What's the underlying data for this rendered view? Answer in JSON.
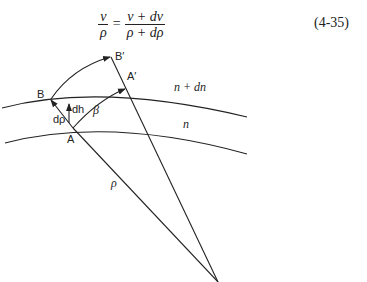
{
  "equation": {
    "lhs_num": "v",
    "lhs_den": "ρ",
    "equals": "=",
    "rhs_num": "v + dv",
    "rhs_den": "ρ + dρ",
    "number": "(4-35)"
  },
  "diagram": {
    "labels": {
      "B": "B",
      "B_prime": "B′",
      "A": "A",
      "A_prime": "A′",
      "n_plus_dn": "n + dn",
      "n": "n",
      "dh": "dh",
      "d_rho": "dρ",
      "beta": "β",
      "rho": "ρ"
    },
    "line_color": "#222222"
  }
}
